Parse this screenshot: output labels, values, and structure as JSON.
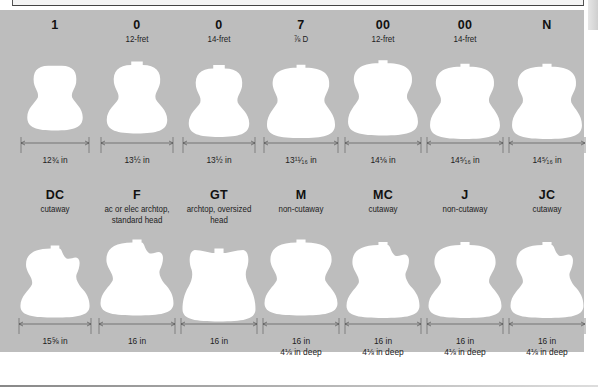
{
  "diagram": {
    "type": "guitar body shape reference",
    "colors": {
      "panel_background": "#bdbdbd",
      "body_shape": "#ffffff",
      "text": "#111111",
      "dimension_line": "#555555"
    },
    "top_row": [
      {
        "model": "1",
        "subtitle": "",
        "width": "12¾ in"
      },
      {
        "model": "0",
        "subtitle": "12-fret",
        "width": "13½ in"
      },
      {
        "model": "0",
        "subtitle": "14-fret",
        "width": "13½ in"
      },
      {
        "model": "7",
        "subtitle": "⅞ D",
        "width": "13¹¹⁄₁₆ in"
      },
      {
        "model": "00",
        "subtitle": "12-fret",
        "width": "14⅛ in"
      },
      {
        "model": "00",
        "subtitle": "14-fret",
        "width": "14⁵⁄₁₆ in"
      },
      {
        "model": "N",
        "subtitle": "",
        "width": "14⁵⁄₁₆ in"
      }
    ],
    "bottom_row": [
      {
        "model": "DC",
        "subtitle_line1": "cutaway",
        "subtitle_line2": "",
        "width": "15⅝ in",
        "depth": ""
      },
      {
        "model": "F",
        "subtitle_line1": "ac or elec archtop,",
        "subtitle_line2": "standard head",
        "width": "16 in",
        "depth": ""
      },
      {
        "model": "GT",
        "subtitle_line1": "archtop, oversized",
        "subtitle_line2": "head",
        "width": "16 in",
        "depth": ""
      },
      {
        "model": "M",
        "subtitle_line1": "non-cutaway",
        "subtitle_line2": "",
        "width": "16 in",
        "depth": "4⅛ in deep"
      },
      {
        "model": "MC",
        "subtitle_line1": "cutaway",
        "subtitle_line2": "",
        "width": "16 in",
        "depth": "4⅛ in deep"
      },
      {
        "model": "J",
        "subtitle_line1": "non-cutaway",
        "subtitle_line2": "",
        "width": "16 in",
        "depth": "4⅛ in deep"
      },
      {
        "model": "JC",
        "subtitle_line1": "cutaway",
        "subtitle_line2": "",
        "width": "16 in",
        "depth": "4⅛ in deep"
      }
    ]
  }
}
